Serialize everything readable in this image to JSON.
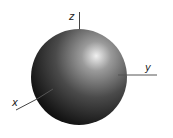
{
  "diagram": {
    "title": "",
    "axes": {
      "x": {
        "label": "x"
      },
      "y": {
        "label": "y"
      },
      "z": {
        "label": "z"
      }
    },
    "sphere": {
      "shade_dark": "#0a0a0a",
      "shade_mid": "#555555",
      "highlight": "#e8e8e8"
    },
    "axis_color": "#444444"
  }
}
